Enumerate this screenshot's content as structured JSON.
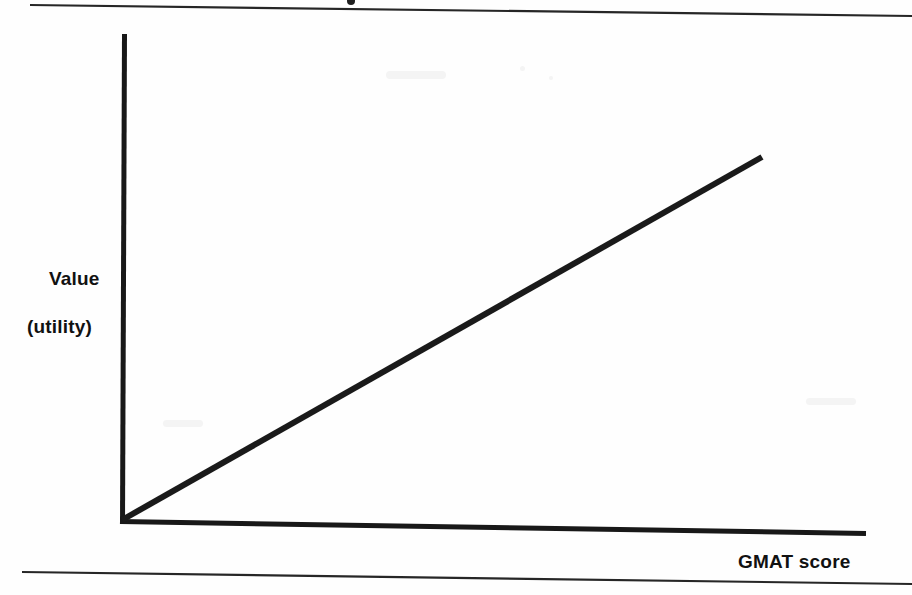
{
  "figure": {
    "type": "scanned-textbook-figure",
    "background_color": "#fefefe",
    "ink_color": "#1a1a1a",
    "width": 912,
    "height": 595
  },
  "labels": {
    "y_axis_line1": "Value",
    "y_axis_line2": "(utility)",
    "x_axis": "GMAT score"
  },
  "rules": {
    "top": {
      "x1": 30,
      "y1": 5,
      "x2": 912,
      "y2": 16,
      "width": 2.2
    },
    "bottom": {
      "x1": 22,
      "y1": 572,
      "x2": 912,
      "y2": 584,
      "width": 2.2
    }
  },
  "marks": {
    "top_dot": {
      "cx": 351,
      "cy": 1,
      "r": 4
    }
  },
  "chart_data": {
    "type": "line",
    "title": "",
    "subtitle": "",
    "xlabel": "GMAT score",
    "ylabel": "Value (utility)",
    "grid": false,
    "legend": null,
    "axis_ticks": {
      "x": [],
      "y": []
    },
    "axes": {
      "y_axis": {
        "x": 124,
        "y_top": 34,
        "y_bottom": 522,
        "width": 5
      },
      "x_axis": {
        "y": 532,
        "x_left": 120,
        "x_right": 866,
        "width": 5
      }
    },
    "series": [
      {
        "name": "Utility of GMAT score",
        "shape": "straight-increasing-line",
        "points": [
          {
            "x": 122,
            "y": 520
          },
          {
            "x": 762,
            "y": 157
          }
        ],
        "line_width": 6,
        "color": "#1a1a1a"
      }
    ],
    "xlim": [
      0,
      1
    ],
    "ylim": [
      0,
      1
    ],
    "annotations": []
  }
}
